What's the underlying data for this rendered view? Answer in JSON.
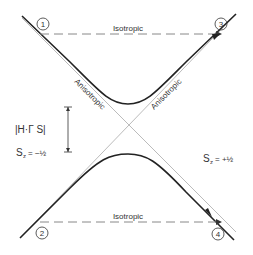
{
  "diagram": {
    "labels": {
      "iso_top": "Isotropic",
      "iso_bottom": "Isotropic",
      "aniso_left": "Anisotropic",
      "aniso_right": "Anisotropic",
      "gap": "|H·Γ S|",
      "sz_minus": "S",
      "sz_minus_sub": "z",
      "sz_minus_val": "= −½",
      "sz_plus": "S",
      "sz_plus_sub": "z",
      "sz_plus_val": "= +½"
    },
    "points": [
      "1",
      "2",
      "3",
      "4"
    ]
  }
}
